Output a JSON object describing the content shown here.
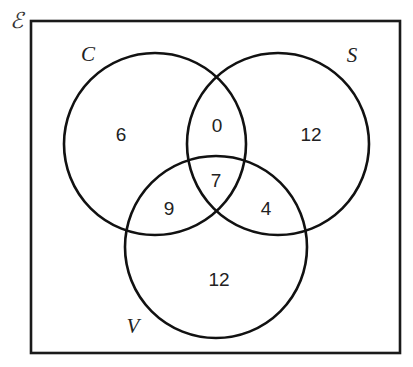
{
  "diagram": {
    "type": "venn",
    "universe": {
      "label": "ℰ",
      "box": {
        "x": 31,
        "y": 21,
        "width": 369,
        "height": 332
      }
    },
    "sets": [
      {
        "id": "C",
        "label": "C",
        "cx": 155,
        "cy": 144,
        "r": 91,
        "label_x": 88,
        "label_y": 54
      },
      {
        "id": "S",
        "label": "S",
        "cx": 278,
        "cy": 144,
        "r": 91,
        "label_x": 352,
        "label_y": 55
      },
      {
        "id": "V",
        "label": "V",
        "cx": 216,
        "cy": 247,
        "r": 91,
        "label_x": 133,
        "label_y": 326
      }
    ],
    "regions": [
      {
        "id": "C-only",
        "sets": [
          "C"
        ],
        "value": "6",
        "x": 121,
        "y": 134
      },
      {
        "id": "C-and-S-only",
        "sets": [
          "C",
          "S"
        ],
        "value": "0",
        "x": 217,
        "y": 125
      },
      {
        "id": "S-only",
        "sets": [
          "S"
        ],
        "value": "12",
        "x": 311,
        "y": 134
      },
      {
        "id": "C-and-S-and-V",
        "sets": [
          "C",
          "S",
          "V"
        ],
        "value": "7",
        "x": 216,
        "y": 180
      },
      {
        "id": "C-and-V-only",
        "sets": [
          "C",
          "V"
        ],
        "value": "9",
        "x": 169,
        "y": 208
      },
      {
        "id": "S-and-V-only",
        "sets": [
          "S",
          "V"
        ],
        "value": "4",
        "x": 266,
        "y": 208
      },
      {
        "id": "V-only",
        "sets": [
          "V"
        ],
        "value": "12",
        "x": 219,
        "y": 279
      }
    ],
    "colors": {
      "stroke": "#111111",
      "text": "#222222",
      "background": "#ffffff"
    }
  }
}
